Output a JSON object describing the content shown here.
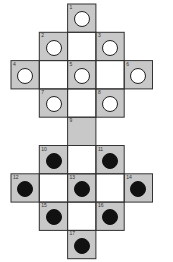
{
  "diagram": {
    "colors": {
      "shaded": "#c8c8c8",
      "blank": "#ffffff",
      "line": "#333333",
      "peg_white": "#ffffff",
      "peg_black": "#111111"
    },
    "cells": [
      {
        "id": "1",
        "col": 2,
        "row": 0,
        "shade": "gray",
        "peg": "empty"
      },
      {
        "id": "2",
        "col": 1,
        "row": 1,
        "shade": "gray",
        "peg": "empty"
      },
      {
        "id": "",
        "col": 2,
        "row": 1,
        "shade": "white",
        "peg": "none"
      },
      {
        "id": "3",
        "col": 3,
        "row": 1,
        "shade": "gray",
        "peg": "empty"
      },
      {
        "id": "4",
        "col": 0,
        "row": 2,
        "shade": "gray",
        "peg": "empty"
      },
      {
        "id": "",
        "col": 1,
        "row": 2,
        "shade": "white",
        "peg": "none"
      },
      {
        "id": "5",
        "col": 2,
        "row": 2,
        "shade": "gray",
        "peg": "empty"
      },
      {
        "id": "",
        "col": 3,
        "row": 2,
        "shade": "white",
        "peg": "none"
      },
      {
        "id": "6",
        "col": 4,
        "row": 2,
        "shade": "gray",
        "peg": "empty"
      },
      {
        "id": "7",
        "col": 1,
        "row": 3,
        "shade": "gray",
        "peg": "empty"
      },
      {
        "id": "",
        "col": 2,
        "row": 3,
        "shade": "white",
        "peg": "none"
      },
      {
        "id": "8",
        "col": 3,
        "row": 3,
        "shade": "gray",
        "peg": "empty"
      },
      {
        "id": "9",
        "col": 2,
        "row": 4,
        "shade": "gray",
        "peg": "none"
      },
      {
        "id": "10",
        "col": 1,
        "row": 5,
        "shade": "gray",
        "peg": "filled"
      },
      {
        "id": "",
        "col": 2,
        "row": 5,
        "shade": "white",
        "peg": "none"
      },
      {
        "id": "11",
        "col": 3,
        "row": 5,
        "shade": "gray",
        "peg": "filled"
      },
      {
        "id": "12",
        "col": 0,
        "row": 6,
        "shade": "gray",
        "peg": "filled"
      },
      {
        "id": "",
        "col": 1,
        "row": 6,
        "shade": "white",
        "peg": "none"
      },
      {
        "id": "13",
        "col": 2,
        "row": 6,
        "shade": "gray",
        "peg": "filled"
      },
      {
        "id": "",
        "col": 3,
        "row": 6,
        "shade": "white",
        "peg": "none"
      },
      {
        "id": "14",
        "col": 4,
        "row": 6,
        "shade": "gray",
        "peg": "filled"
      },
      {
        "id": "15",
        "col": 1,
        "row": 7,
        "shade": "gray",
        "peg": "filled"
      },
      {
        "id": "",
        "col": 2,
        "row": 7,
        "shade": "white",
        "peg": "none"
      },
      {
        "id": "16",
        "col": 3,
        "row": 7,
        "shade": "gray",
        "peg": "filled"
      },
      {
        "id": "17",
        "col": 2,
        "row": 8,
        "shade": "gray",
        "peg": "filled"
      }
    ]
  }
}
